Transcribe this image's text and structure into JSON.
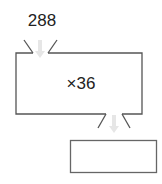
{
  "diagram": {
    "input_value": "288",
    "operation": "×36",
    "output_value": "",
    "colors": {
      "stroke": "#555555",
      "arrow": "#e4e4e4",
      "text": "#222222",
      "background": "#ffffff"
    }
  }
}
